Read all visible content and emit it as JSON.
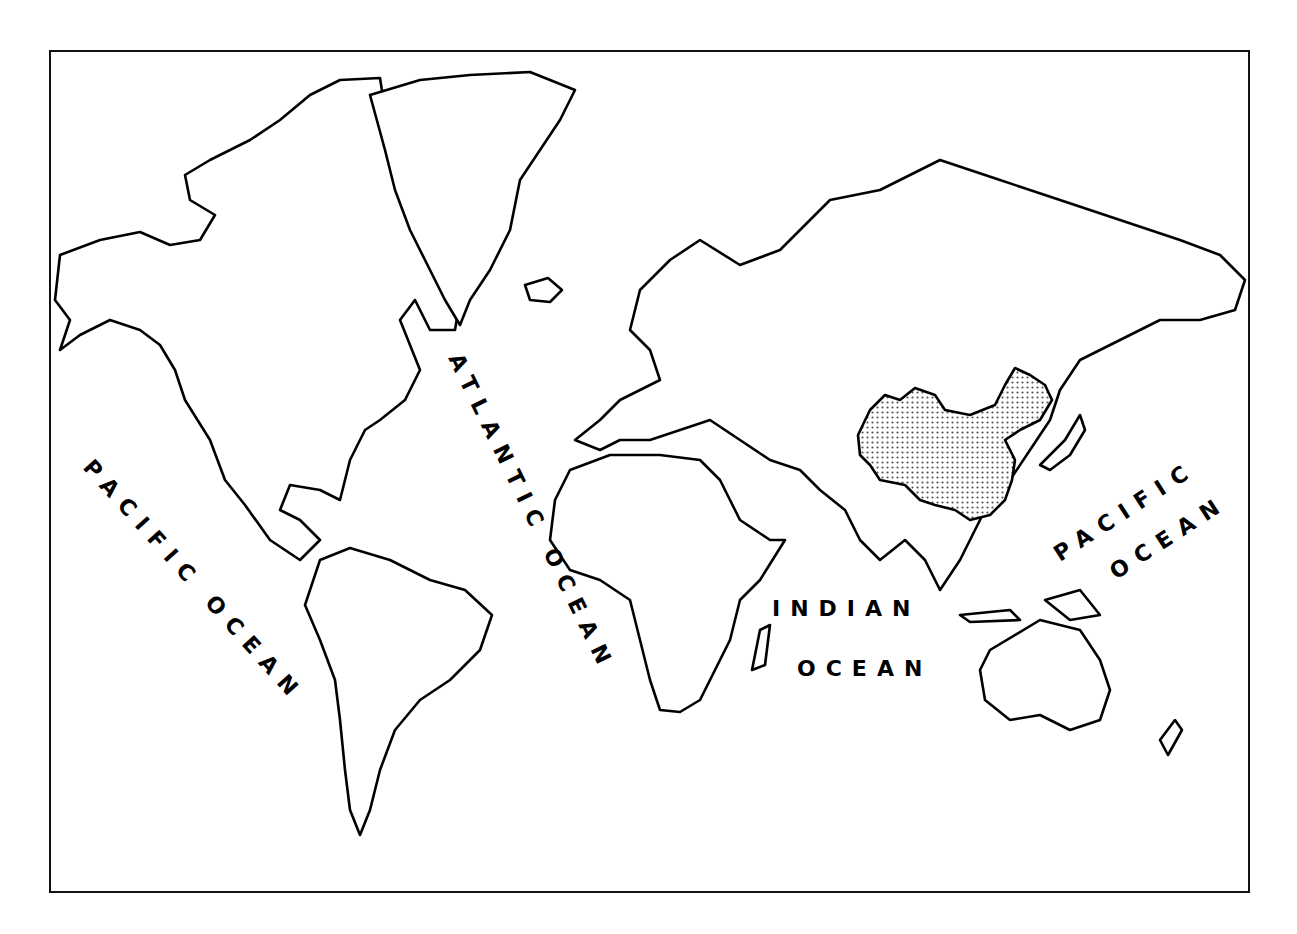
{
  "map": {
    "title": "",
    "style": "outline world map, Mercator-like projection",
    "highlighted_region": {
      "name": "China",
      "pattern": "stipple",
      "color": "#bdbdbd"
    },
    "ocean_labels": [
      {
        "id": "pacific-west",
        "text": "PACIFIC OCEAN"
      },
      {
        "id": "atlantic",
        "text": "ATLANTIC OCEAN"
      },
      {
        "id": "indian-line1",
        "text": "INDIAN"
      },
      {
        "id": "indian-line2",
        "text": "OCEAN"
      },
      {
        "id": "pacific-east-line1",
        "text": "PACIFIC"
      },
      {
        "id": "pacific-east-line2",
        "text": "OCEAN"
      }
    ],
    "colors": {
      "outline": "#000000",
      "background": "#ffffff",
      "highlight": "#bdbdbd"
    }
  }
}
